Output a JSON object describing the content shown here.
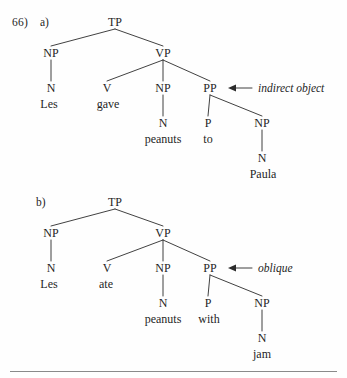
{
  "page": {
    "example_number": "66)",
    "background_color": "#fefefe",
    "ink_color": "#1f1f1f",
    "rule_color": "#8a8a8a"
  },
  "trees": [
    {
      "id": "tree-a",
      "label": "a)",
      "sentence": "Les gave peanuts to Paula",
      "annotation": {
        "text": "indirect object",
        "points_to": "PP",
        "arrow_direction": "left"
      },
      "nodes": [
        {
          "id": "TP",
          "label": "TP",
          "x": 115,
          "y": 26
        },
        {
          "id": "NP1",
          "label": "NP",
          "x": 51,
          "y": 57
        },
        {
          "id": "VP",
          "label": "VP",
          "x": 163,
          "y": 57
        },
        {
          "id": "N1",
          "label": "N",
          "x": 51,
          "y": 92
        },
        {
          "id": "V",
          "label": "V",
          "x": 107,
          "y": 92
        },
        {
          "id": "NP2",
          "label": "NP",
          "x": 163,
          "y": 92
        },
        {
          "id": "PP",
          "label": "PP",
          "x": 210,
          "y": 92
        },
        {
          "id": "N2",
          "label": "N",
          "x": 163,
          "y": 127
        },
        {
          "id": "P",
          "label": "P",
          "x": 208,
          "y": 127
        },
        {
          "id": "NP3",
          "label": "NP",
          "x": 262,
          "y": 127
        },
        {
          "id": "N3",
          "label": "N",
          "x": 262,
          "y": 162
        }
      ],
      "edges": [
        {
          "from": "TP",
          "to": "NP1"
        },
        {
          "from": "TP",
          "to": "VP"
        },
        {
          "from": "NP1",
          "to": "N1"
        },
        {
          "from": "VP",
          "to": "V"
        },
        {
          "from": "VP",
          "to": "NP2"
        },
        {
          "from": "VP",
          "to": "PP"
        },
        {
          "from": "NP2",
          "to": "N2"
        },
        {
          "from": "PP",
          "to": "P"
        },
        {
          "from": "PP",
          "to": "NP3"
        },
        {
          "from": "NP3",
          "to": "N3"
        }
      ],
      "words": [
        {
          "id": "w-les",
          "text": "Les",
          "x": 49,
          "y": 108
        },
        {
          "id": "w-gave",
          "text": "gave",
          "x": 108,
          "y": 108
        },
        {
          "id": "w-peanuts",
          "text": "peanuts",
          "x": 163,
          "y": 143
        },
        {
          "id": "w-to",
          "text": "to",
          "x": 208,
          "y": 143
        },
        {
          "id": "w-paula",
          "text": "Paula",
          "x": 263,
          "y": 178
        }
      ]
    },
    {
      "id": "tree-b",
      "label": "b)",
      "sentence": "Les ate peanuts with jam",
      "annotation": {
        "text": "oblique",
        "points_to": "PP",
        "arrow_direction": "left"
      },
      "nodes": [
        {
          "id": "TP",
          "label": "TP",
          "x": 115,
          "y": 206
        },
        {
          "id": "NP1",
          "label": "NP",
          "x": 51,
          "y": 237
        },
        {
          "id": "VP",
          "label": "VP",
          "x": 163,
          "y": 237
        },
        {
          "id": "N1",
          "label": "N",
          "x": 51,
          "y": 272
        },
        {
          "id": "V",
          "label": "V",
          "x": 107,
          "y": 272
        },
        {
          "id": "NP2",
          "label": "NP",
          "x": 163,
          "y": 272
        },
        {
          "id": "PP",
          "label": "PP",
          "x": 210,
          "y": 272
        },
        {
          "id": "N2",
          "label": "N",
          "x": 163,
          "y": 307
        },
        {
          "id": "P",
          "label": "P",
          "x": 208,
          "y": 307
        },
        {
          "id": "NP3",
          "label": "NP",
          "x": 262,
          "y": 307
        },
        {
          "id": "N3",
          "label": "N",
          "x": 262,
          "y": 342
        }
      ],
      "edges": [
        {
          "from": "TP",
          "to": "NP1"
        },
        {
          "from": "TP",
          "to": "VP"
        },
        {
          "from": "NP1",
          "to": "N1"
        },
        {
          "from": "VP",
          "to": "V"
        },
        {
          "from": "VP",
          "to": "NP2"
        },
        {
          "from": "VP",
          "to": "PP"
        },
        {
          "from": "NP2",
          "to": "N2"
        },
        {
          "from": "PP",
          "to": "P"
        },
        {
          "from": "PP",
          "to": "NP3"
        },
        {
          "from": "NP3",
          "to": "N3"
        }
      ],
      "words": [
        {
          "id": "w-les",
          "text": "Les",
          "x": 49,
          "y": 288
        },
        {
          "id": "w-ate",
          "text": "ate",
          "x": 106,
          "y": 288
        },
        {
          "id": "w-peanuts",
          "text": "peanuts",
          "x": 163,
          "y": 323
        },
        {
          "id": "w-with",
          "text": "with",
          "x": 209,
          "y": 323
        },
        {
          "id": "w-jam",
          "text": "jam",
          "x": 262,
          "y": 358
        }
      ]
    }
  ],
  "annotations": [
    {
      "id": "ann-a",
      "text": "indirect object",
      "arrow_x1": 252,
      "arrow_x2": 228,
      "arrow_y": 88,
      "text_x": 258
    },
    {
      "id": "ann-b",
      "text": "oblique",
      "arrow_x1": 252,
      "arrow_x2": 228,
      "arrow_y": 268,
      "text_x": 258
    }
  ]
}
